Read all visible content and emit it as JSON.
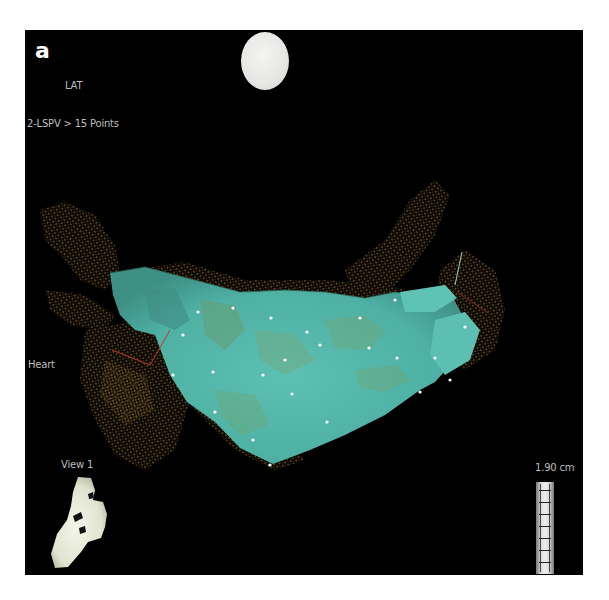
{
  "figure": {
    "panel_letter": "a"
  },
  "viewport": {
    "map_type_label": "LAT",
    "map_name_label": "2-LSPV > 15 Points",
    "catheter_label": "Heart",
    "view_label": "View 1",
    "scale_label": "1.90 cm"
  },
  "icons": {
    "orientation_ball": "orientation-sphere-icon",
    "mini_heart": "heart-orientation-icon",
    "scale_bar": "ruler-icon"
  },
  "colors": {
    "background": "#000000",
    "surface_teal": "#4fb0a4",
    "mesh_brown": "#8a6a2e",
    "point_white": "#ffffff",
    "catheter_red": "#c0392b",
    "label_gray": "#bdbdbd"
  }
}
